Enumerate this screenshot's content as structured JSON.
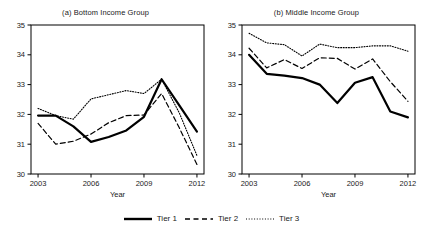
{
  "chart_data": [
    {
      "type": "line",
      "title": "(a) Bottom Income Group",
      "xlabel": "Year",
      "ylabel": "",
      "x": [
        2003,
        2004,
        2005,
        2006,
        2007,
        2008,
        2009,
        2010,
        2011,
        2012
      ],
      "xlim": [
        2002.6,
        2012.4
      ],
      "ylim": [
        30,
        35
      ],
      "xticks": [
        2003,
        2006,
        2009,
        2012
      ],
      "yticks": [
        30,
        31,
        32,
        33,
        34,
        35
      ],
      "grid": false,
      "legend_position": "bottom-center-shared",
      "series": [
        {
          "name": "Tier 1",
          "style": "solid",
          "values": [
            31.96,
            31.96,
            31.6,
            31.08,
            31.24,
            31.46,
            31.92,
            33.18,
            32.3,
            31.42
          ]
        },
        {
          "name": "Tier 2",
          "style": "dashed",
          "values": [
            31.7,
            31.0,
            31.1,
            31.34,
            31.72,
            31.96,
            31.98,
            32.7,
            31.55,
            30.32
          ]
        },
        {
          "name": "Tier 3",
          "style": "dotted",
          "values": [
            32.2,
            31.96,
            31.84,
            32.52,
            32.66,
            32.8,
            32.7,
            33.18,
            32.05,
            30.62
          ]
        }
      ]
    },
    {
      "type": "line",
      "title": "(b) Middle Income Group",
      "xlabel": "Year",
      "ylabel": "",
      "x": [
        2003,
        2004,
        2005,
        2006,
        2007,
        2008,
        2009,
        2010,
        2011,
        2012
      ],
      "xlim": [
        2002.6,
        2012.4
      ],
      "ylim": [
        30,
        35
      ],
      "xticks": [
        2003,
        2006,
        2009,
        2012
      ],
      "yticks": [
        30,
        31,
        32,
        33,
        34,
        35
      ],
      "grid": false,
      "legend_position": "bottom-center-shared",
      "series": [
        {
          "name": "Tier 1",
          "style": "solid",
          "values": [
            34.0,
            33.36,
            33.3,
            33.22,
            33.0,
            32.38,
            33.06,
            33.25,
            32.1,
            31.9
          ]
        },
        {
          "name": "Tier 2",
          "style": "dashed",
          "values": [
            34.22,
            33.56,
            33.84,
            33.54,
            33.9,
            33.88,
            33.52,
            33.86,
            33.1,
            32.44
          ]
        },
        {
          "name": "Tier 3",
          "style": "dotted",
          "values": [
            34.72,
            34.4,
            34.34,
            33.96,
            34.36,
            34.24,
            34.24,
            34.3,
            34.3,
            34.12
          ]
        }
      ]
    }
  ],
  "legend": {
    "items": [
      {
        "label": "Tier 1",
        "style": "solid"
      },
      {
        "label": "Tier 2",
        "style": "dashed"
      },
      {
        "label": "Tier 3",
        "style": "dotted"
      }
    ]
  },
  "colors": {
    "line": "#000000",
    "axis": "#000000",
    "text": "#1a1a1a",
    "background": "#ffffff"
  }
}
